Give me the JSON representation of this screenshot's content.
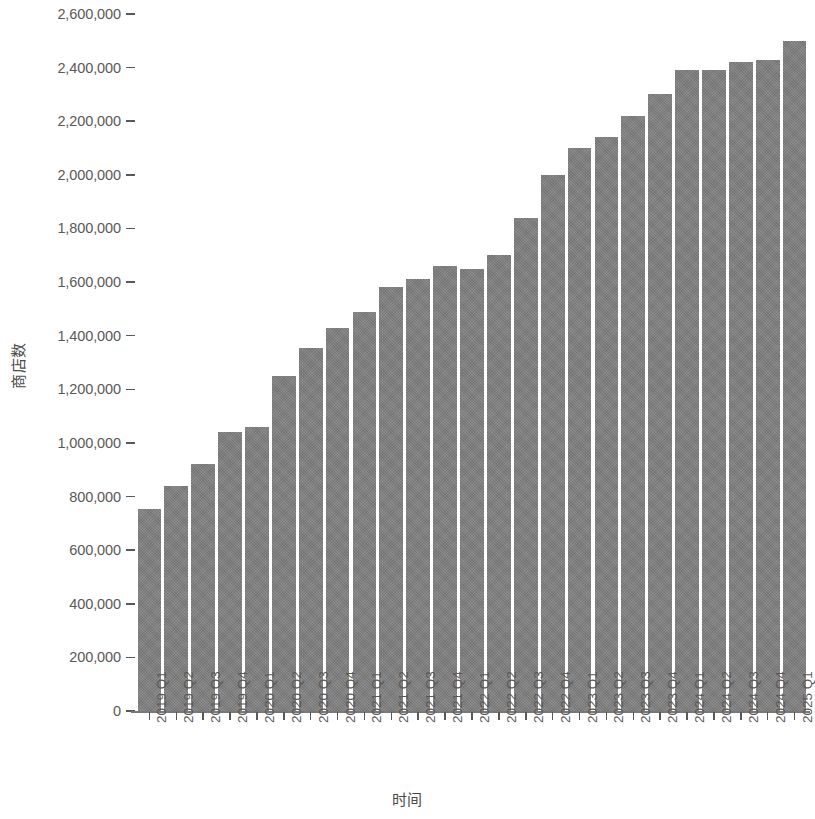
{
  "chart_data": {
    "type": "bar",
    "title": "",
    "subtitle": "",
    "xlabel": "时间",
    "ylabel": "商店数",
    "grid": false,
    "legend": null,
    "ylim": [
      0,
      2600000
    ],
    "ytick_step": 200000,
    "ytick_labels": [
      "2,600,000",
      "2,400,000",
      "2,200,000",
      "2,000,000",
      "1,800,000",
      "1,600,000",
      "1,400,000",
      "1,200,000",
      "1,000,000",
      "800,000",
      "600,000",
      "400,000",
      "200,000",
      "0"
    ],
    "ytick_values": [
      2600000,
      2400000,
      2200000,
      2000000,
      1800000,
      1600000,
      1400000,
      1200000,
      1000000,
      800000,
      600000,
      400000,
      200000,
      0
    ],
    "categories": [
      "2019 Q1",
      "2019 Q2",
      "2019 Q3",
      "2019 Q4",
      "2020 Q1",
      "2020 Q2",
      "2020 Q3",
      "2020 Q4",
      "2021 Q1",
      "2021 Q2",
      "2021 Q3",
      "2021 Q4",
      "2022 Q1",
      "2022 Q2",
      "2022 Q3",
      "2022 Q4",
      "2023 Q1",
      "2023 Q2",
      "2023 Q3",
      "2023 Q4",
      "2024 Q1",
      "2024 Q2",
      "2024 Q3",
      "2024 Q4",
      "2025 Q1"
    ],
    "values": [
      755000,
      840000,
      920000,
      1040000,
      1060000,
      1250000,
      1355000,
      1430000,
      1490000,
      1580000,
      1610000,
      1660000,
      1650000,
      1700000,
      1840000,
      2000000,
      2100000,
      2140000,
      2220000,
      2300000,
      2390000,
      2390000,
      2420000,
      2430000,
      2500000
    ],
    "bar_color": "#808080",
    "axis_color": "#595959",
    "text_color": "#4a4a4a",
    "background_color": "#ffffff"
  }
}
